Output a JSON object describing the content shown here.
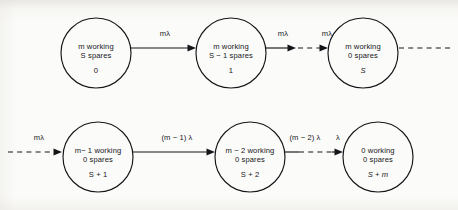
{
  "diagram": {
    "type": "state-transition-diagram",
    "background_color": "#fbfbf9",
    "line_color": "#16161a",
    "node_radius": 35,
    "nodes": [
      {
        "id": "n0",
        "line1": "m working",
        "line2": "S spares",
        "index": "0",
        "cx": 96,
        "cy": 53,
        "row": "top"
      },
      {
        "id": "n1",
        "line1": "m working",
        "line2": "S − 1 spares",
        "index": "1",
        "cx": 231,
        "cy": 53,
        "row": "top"
      },
      {
        "id": "n2",
        "line1": "m working",
        "line2": "0 spares",
        "index": "S",
        "cx": 363,
        "cy": 53,
        "row": "top"
      },
      {
        "id": "n3",
        "line1": "m− 1 working",
        "line2": "0 spares",
        "index": "S + 1",
        "cx": 98,
        "cy": 157,
        "row": "bottom"
      },
      {
        "id": "n4",
        "line1": "m − 2 working",
        "line2": "0 spares",
        "index": "S + 2",
        "cx": 250,
        "cy": 157,
        "row": "bottom"
      },
      {
        "id": "n5",
        "line1": "0 working",
        "line2": "0 spares",
        "index": "S + m",
        "cx": 378,
        "cy": 157,
        "row": "bottom"
      }
    ],
    "edges": [
      {
        "id": "e0",
        "label": "mλ",
        "style": "solid",
        "from": "n0",
        "to": "n1",
        "label_x": 165,
        "label_y": 34
      },
      {
        "id": "e1",
        "label": "mλ",
        "style": "solid",
        "from": "n1",
        "to": "dots",
        "label_x": 283,
        "label_y": 34
      },
      {
        "id": "e2",
        "label": "mλ",
        "style": "dashed",
        "from": "dots",
        "to": "n2",
        "label_x": 327,
        "label_y": 34
      },
      {
        "id": "e3",
        "label": "",
        "style": "dashed-tail",
        "from": "n2",
        "to": "continuation",
        "label_x": 0,
        "label_y": 0
      },
      {
        "id": "e4",
        "label": "mλ",
        "style": "dashed-head",
        "from": "continuation",
        "to": "n3",
        "label_x": 39,
        "label_y": 138
      },
      {
        "id": "e5",
        "label": "(m − 1) λ",
        "style": "solid",
        "from": "n3",
        "to": "n4",
        "label_x": 177,
        "label_y": 138
      },
      {
        "id": "e6",
        "label": "(m − 2) λ",
        "style": "solid-stub",
        "from": "n4",
        "to": "dots2",
        "label_x": 305,
        "label_y": 138
      },
      {
        "id": "e7",
        "label": "λ",
        "style": "dashed-head",
        "from": "dots2",
        "to": "n5",
        "label_x": 338,
        "label_y": 138
      }
    ]
  }
}
